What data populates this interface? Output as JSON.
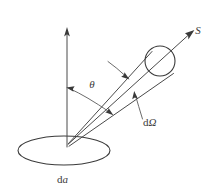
{
  "figure": {
    "background_color": "#ffffff",
    "line_color": "#4a4a4a",
    "text_color": "#3a3a3a",
    "width": 218,
    "height": 192
  },
  "labels": {
    "flux_vector": "S",
    "angle": "θ",
    "solid_angle_d": "d",
    "solid_angle_omega": "Ω",
    "area_element_d": "d",
    "area_element_a": "a"
  },
  "geometry": {
    "apex": {
      "x": 67,
      "y": 145
    },
    "normal_arrow_tip": {
      "x": 67,
      "y": 28
    },
    "ellipse": {
      "cx": 64,
      "cy": 150.5,
      "rx": 46,
      "ry": 14.5
    },
    "beam_circle": {
      "cx": 160,
      "cy": 61,
      "r": 15
    },
    "s_arrow_tip": {
      "x": 193,
      "y": 32
    },
    "cone_upper_ray_end": {
      "x": 152,
      "y": 52
    },
    "cone_lower_ray_end": {
      "x": 172,
      "y": 73
    },
    "theta_arc_start": {
      "x": 67,
      "y": 88
    },
    "theta_arc_end": {
      "x": 111,
      "y": 113
    }
  }
}
